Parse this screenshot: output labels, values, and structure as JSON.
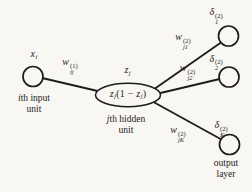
{
  "figure": {
    "background": "#f8f7f3",
    "ink": "#1e1c1a",
    "input_node": {
      "activation": {
        "base": "x",
        "sub": "i"
      },
      "caption": {
        "italic": "i",
        "rest": "th input",
        "line2": "unit"
      }
    },
    "hidden_node": {
      "activation": {
        "base": "z",
        "sub": "j"
      },
      "derivative": {
        "b1": "z",
        "s1": "j",
        "mid": "(1 − ",
        "b2": "z",
        "s2": "j",
        "close": ")"
      },
      "caption": {
        "italic": "j",
        "rest": "th hidden",
        "line2": "unit"
      }
    },
    "weights": {
      "input_hidden": {
        "base": "w",
        "sub": "ij",
        "sup": "(1)"
      },
      "hidden_out1": {
        "base": "w",
        "sub": "j1",
        "sup": "(2)"
      },
      "hidden_out2": {
        "base": "w",
        "sub": "j2",
        "sup": "(2)"
      },
      "hidden_outK": {
        "base": "w",
        "sub": "jK",
        "sup": "(2)"
      }
    },
    "output_nodes": [
      {
        "label": {
          "base": "δ",
          "sub": "1",
          "sup": "(2)"
        }
      },
      {
        "label": {
          "base": "δ",
          "sub": "2",
          "sup": "(2)"
        }
      },
      {
        "label": {
          "base": "δ",
          "sub": "K",
          "sup": "(2)"
        }
      }
    ],
    "output_caption": {
      "line1": "output",
      "line2": "layer"
    }
  }
}
